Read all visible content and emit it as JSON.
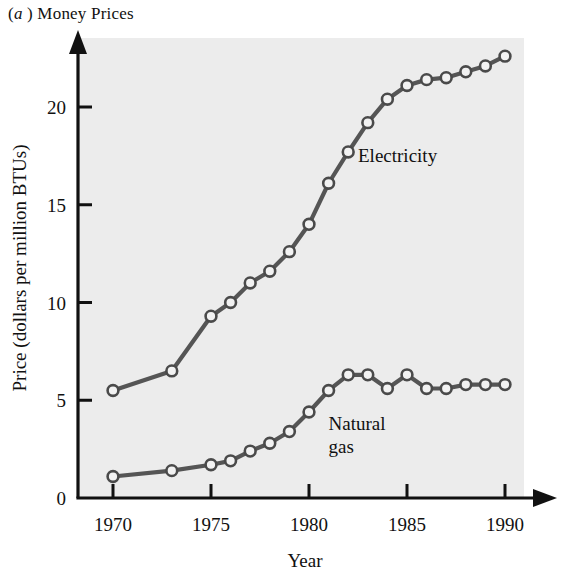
{
  "figure": {
    "panel_letter": "a",
    "caption_prefix": "(",
    "caption_suffix": ")",
    "caption_text": "Money Prices",
    "full_caption": "(a ) Money Prices"
  },
  "colors": {
    "plot_background": "#ececec",
    "page_background": "#ffffff",
    "axis": "#111111",
    "line": "#555555",
    "marker_fill": "#f2f2f2",
    "marker_stroke": "#4a4a4a",
    "text": "#111111"
  },
  "chart_data": {
    "type": "line",
    "xlabel": "Year",
    "ylabel": "Price (dollars per million BTUs)",
    "xlim": [
      1969.2,
      1991.5
    ],
    "ylim": [
      0,
      23.5
    ],
    "xticks": [
      1970,
      1975,
      1980,
      1985,
      1990
    ],
    "xtick_labels": [
      "1970",
      "1975",
      "1980",
      "1985",
      "1990"
    ],
    "yticks": [
      0,
      5,
      10,
      15,
      20
    ],
    "ytick_labels": [
      "0",
      "5",
      "10",
      "15",
      "20"
    ],
    "grid": false,
    "legend": "inline-annotations",
    "markers": "open-circle",
    "series": [
      {
        "name": "Electricity",
        "label_x": 1982.5,
        "label_y": 17.2,
        "x": [
          1970,
          1973,
          1975,
          1976,
          1977,
          1978,
          1979,
          1980,
          1981,
          1982,
          1983,
          1984,
          1985,
          1986,
          1987,
          1988,
          1989,
          1990
        ],
        "y": [
          5.5,
          6.5,
          9.3,
          10.0,
          11.0,
          11.6,
          12.6,
          14.0,
          16.1,
          17.7,
          19.2,
          20.4,
          21.1,
          21.4,
          21.5,
          21.8,
          22.1,
          22.6
        ],
        "values": [
          5.5,
          6.5,
          9.3,
          10.0,
          11.0,
          11.6,
          12.6,
          14.0,
          16.1,
          17.7,
          19.2,
          20.4,
          21.1,
          21.4,
          21.5,
          21.8,
          22.1,
          22.6
        ]
      },
      {
        "name": "Natural gas",
        "label_line1": "Natural",
        "label_line2": "gas",
        "label_x": 1981.0,
        "label_y": 3.5,
        "x": [
          1970,
          1973,
          1975,
          1976,
          1977,
          1978,
          1979,
          1980,
          1981,
          1982,
          1983,
          1984,
          1985,
          1986,
          1987,
          1988,
          1989,
          1990
        ],
        "y": [
          1.1,
          1.4,
          1.7,
          1.9,
          2.4,
          2.8,
          3.4,
          4.4,
          5.5,
          6.3,
          6.3,
          5.6,
          6.3,
          5.6,
          5.6,
          5.8,
          5.8,
          5.8
        ],
        "values": [
          1.1,
          1.4,
          1.7,
          1.9,
          2.4,
          2.8,
          3.4,
          4.4,
          5.5,
          6.3,
          6.3,
          5.6,
          6.3,
          5.6,
          5.6,
          5.8,
          5.8,
          5.8
        ]
      }
    ]
  }
}
